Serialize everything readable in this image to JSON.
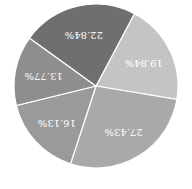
{
  "chart_data": {
    "type": "pie",
    "title": "",
    "orientation": "rotated 180 degrees",
    "categories": [
      "Slice A",
      "Slice B",
      "Slice C",
      "Slice D",
      "Slice E"
    ],
    "values": [
      19.84,
      27.43,
      16.13,
      13.77,
      22.84
    ],
    "labels": [
      "19.84%",
      "27.43%",
      "16.13%",
      "13.77%",
      "22.84%"
    ],
    "colors": [
      "#c4c4c4",
      "#a9a9a9",
      "#9a9a9a",
      "#8e8e8e",
      "#6f6f6f"
    ],
    "legend": "none"
  }
}
